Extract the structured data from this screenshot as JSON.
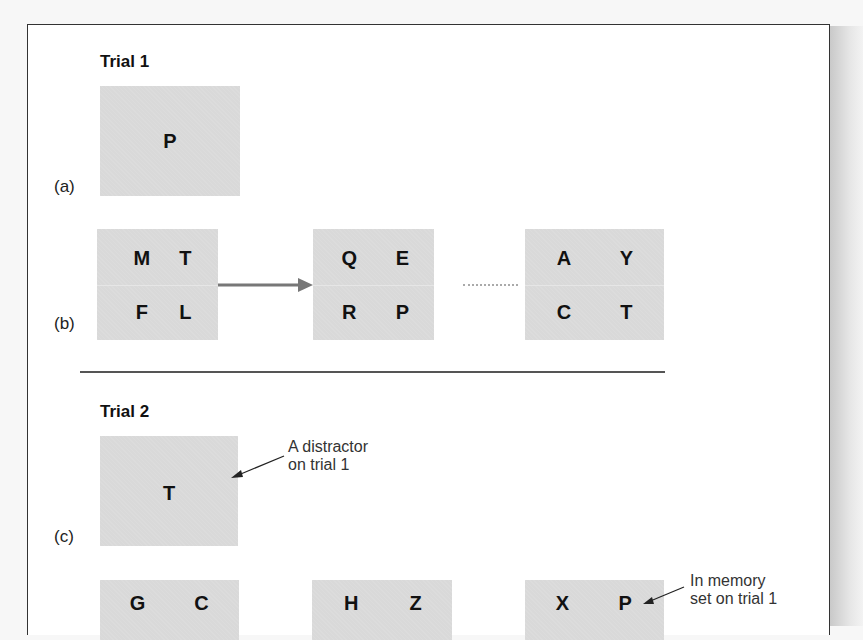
{
  "trial1": {
    "title": "Trial 1",
    "panel_a": {
      "label": "(a)",
      "target_letter": "P"
    },
    "panel_b": {
      "label": "(b)",
      "frames": [
        {
          "letters": [
            "M",
            "T",
            "F",
            "L"
          ]
        },
        {
          "letters": [
            "Q",
            "E",
            "R",
            "P"
          ]
        },
        {
          "letters": [
            "A",
            "Y",
            "C",
            "T"
          ]
        }
      ]
    }
  },
  "trial2": {
    "title": "Trial 2",
    "panel_c": {
      "label": "(c)",
      "target_letter": "T",
      "annotation_line1": "A distractor",
      "annotation_line2": "on trial 1"
    },
    "panel_d": {
      "frames": [
        {
          "letters": [
            "G",
            "C"
          ]
        },
        {
          "letters": [
            "H",
            "Z"
          ]
        },
        {
          "letters": [
            "X",
            "P"
          ]
        }
      ],
      "annotation_line1": "In memory",
      "annotation_line2": "set on trial 1"
    }
  },
  "colors": {
    "box_fill": "#d9d9d9",
    "arrow": "#777777",
    "frame_border": "#333333"
  }
}
